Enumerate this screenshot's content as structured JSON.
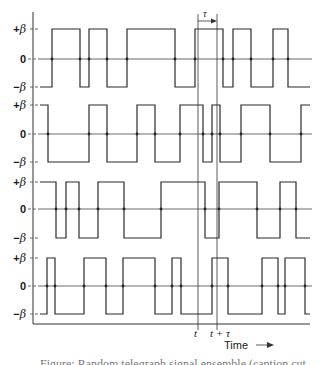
{
  "figure": {
    "level_labels": {
      "plus": "+",
      "zero": "0",
      "minus": "−",
      "beta": "β"
    },
    "time_markers": {
      "t": "t",
      "t_plus_tau": "t + τ",
      "tau": "τ"
    },
    "time_axis_label": "Time ⟶",
    "caption": "Figure: Random telegraph signal ensemble (caption cut off)"
  },
  "chart_data": {
    "type": "line",
    "title": "",
    "xlabel": "Time",
    "ylabel": "",
    "y_levels": [
      "+β",
      "0",
      "−β"
    ],
    "grid": false,
    "annotations": [
      "t",
      "t + τ",
      "τ"
    ],
    "series": [
      {
        "name": "Sample function 1",
        "start_level": "-β",
        "transition_x": [
          52,
          80,
          89,
          107,
          127,
          175,
          195,
          223,
          233,
          251,
          273,
          288
        ]
      },
      {
        "name": "Sample function 2",
        "start_level": "+β",
        "transition_x": [
          48,
          89,
          107,
          137,
          155,
          180,
          203,
          212,
          220,
          241,
          270,
          301
        ]
      },
      {
        "name": "Sample function 3",
        "start_level": "+β",
        "transition_x": [
          56,
          66,
          79,
          98,
          124,
          161,
          205,
          219,
          257,
          280,
          296
        ]
      },
      {
        "name": "Sample function 4",
        "start_level": "-β",
        "transition_x": [
          47,
          55,
          84,
          106,
          123,
          155,
          172,
          181,
          212,
          228,
          262,
          278,
          285,
          305
        ]
      }
    ]
  }
}
